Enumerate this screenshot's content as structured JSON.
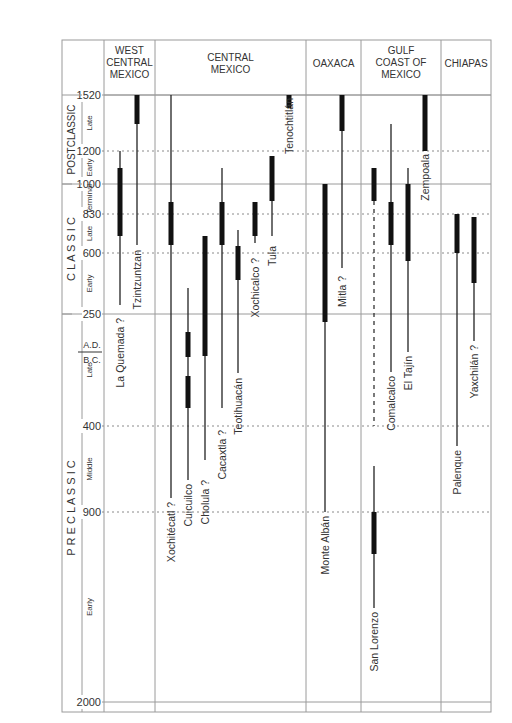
{
  "chart_data": {
    "type": "timeline",
    "title": "",
    "y_axis": {
      "ticks": [
        {
          "label": "1520",
          "y": 95,
          "style": "solid"
        },
        {
          "label": "1200",
          "y": 151,
          "style": "dotted"
        },
        {
          "label": "1000",
          "y": 184,
          "style": "solid"
        },
        {
          "label": "830",
          "y": 214,
          "style": "dotted"
        },
        {
          "label": "600",
          "y": 253,
          "style": "dotted"
        },
        {
          "label": "250",
          "y": 314,
          "style": "solid"
        },
        {
          "label": "400",
          "y": 426,
          "style": "dotted"
        },
        {
          "label": "900",
          "y": 512,
          "style": "dotted"
        },
        {
          "label": "2000",
          "y": 702,
          "style": "solid"
        }
      ],
      "era_divider": {
        "upper": "A.D.",
        "lower": "B.C.",
        "y": 352
      }
    },
    "periods": [
      {
        "name": "POSTCLASSIC",
        "y0": 95,
        "y1": 184,
        "subperiods": [
          {
            "name": "Late",
            "y0": 95,
            "y1": 151
          },
          {
            "name": "Early",
            "y0": 151,
            "y1": 184
          }
        ]
      },
      {
        "name": "C L A S S I C",
        "y0": 184,
        "y1": 314,
        "subperiods": [
          {
            "name": "Terminal",
            "y0": 184,
            "y1": 214
          },
          {
            "name": "Late",
            "y0": 214,
            "y1": 253
          },
          {
            "name": "Early",
            "y0": 253,
            "y1": 314
          }
        ]
      },
      {
        "name": "P R E C L A S S I C",
        "y0": 314,
        "y1": 702,
        "subperiods": [
          {
            "name": "Late",
            "y0": 314,
            "y1": 426
          },
          {
            "name": "Middle",
            "y0": 426,
            "y1": 512
          },
          {
            "name": "Early",
            "y0": 512,
            "y1": 702
          }
        ]
      }
    ],
    "regions": [
      {
        "name": [
          "WEST",
          "CENTRAL",
          "MEXICO"
        ],
        "x0": 104,
        "x1": 155
      },
      {
        "name": [
          "CENTRAL",
          "MEXICO"
        ],
        "x0": 155,
        "x1": 306
      },
      {
        "name": [
          "OAXACA"
        ],
        "x0": 306,
        "x1": 361
      },
      {
        "name": [
          "GULF",
          "COAST OF",
          "MEXICO"
        ],
        "x0": 361,
        "x1": 441
      },
      {
        "name": [
          "CHIAPAS"
        ],
        "x0": 441,
        "x1": 491
      }
    ],
    "sites": [
      {
        "name": "La Quemada",
        "region": "West Central Mexico",
        "x": 120,
        "line": [
          151,
          305
        ],
        "bar": [
          168,
          236
        ],
        "question": true,
        "label_y": 318
      },
      {
        "name": "Tzintzuntzan",
        "region": "West Central Mexico",
        "x": 137,
        "line": [
          95,
          245
        ],
        "bar": [
          95,
          124
        ],
        "question": false,
        "label_y": 250
      },
      {
        "name": "Xochitécatl",
        "region": "Central Mexico",
        "x": 171,
        "line": [
          95,
          498
        ],
        "bar": [
          202,
          245
        ],
        "question": true,
        "label_y": 502
      },
      {
        "name": "Cuicuilco",
        "region": "Central Mexico",
        "x": 188,
        "line": [
          288,
          480
        ],
        "bar": [
          332,
          357
        ],
        "bar2": [
          376,
          408
        ],
        "question": false,
        "label_y": 484
      },
      {
        "name": "Cholula",
        "region": "Central Mexico",
        "x": 205,
        "line": [
          236,
          460
        ],
        "bar": [
          236,
          356
        ],
        "question": true,
        "label_y": 480
      },
      {
        "name": "Cacaxtla",
        "region": "Central Mexico",
        "x": 222,
        "line": [
          168,
          408
        ],
        "bar": [
          202,
          245
        ],
        "question": true,
        "label_y": 430
      },
      {
        "name": "Teotihuacán",
        "region": "Central Mexico",
        "x": 238,
        "line": [
          230,
          373
        ],
        "bar": [
          246,
          280
        ],
        "question": false,
        "label_y": 378
      },
      {
        "name": "Xochicalco",
        "region": "Central Mexico",
        "x": 255,
        "line": [
          202,
          243
        ],
        "bar": [
          202,
          236
        ],
        "question": true,
        "label_y": 258
      },
      {
        "name": "Tula",
        "region": "Central Mexico",
        "x": 272,
        "line": [
          156,
          236
        ],
        "bar": [
          156,
          201
        ],
        "question": false,
        "label_y": 246
      },
      {
        "name": "Tenochtitlán",
        "region": "Central Mexico",
        "x": 289,
        "line": [
          95,
          108
        ],
        "bar": [
          95,
          108
        ],
        "question": false,
        "label_y": 98
      },
      {
        "name": "Monte Albán",
        "region": "Oaxaca",
        "x": 325,
        "line": [
          184,
          512
        ],
        "bar": [
          184,
          322
        ],
        "question": false,
        "label_y": 516
      },
      {
        "name": "Mitla",
        "region": "Oaxaca",
        "x": 342,
        "line": [
          95,
          268
        ],
        "bar": [
          95,
          131
        ],
        "question": true,
        "label_y": 276
      },
      {
        "name": "San Lorenzo",
        "region": "Gulf Coast of Mexico",
        "x": 374,
        "line": [
          168,
          608
        ],
        "bar": [
          168,
          201
        ],
        "bar2": [
          512,
          554
        ],
        "dashed": [
          201,
          426
        ],
        "question": false,
        "label_y": 612
      },
      {
        "name": "Comalcalco",
        "region": "Gulf Coast of Mexico",
        "x": 391,
        "line": [
          124,
          372
        ],
        "bar": [
          202,
          245
        ],
        "question": false,
        "label_y": 376
      },
      {
        "name": "El Tajín",
        "region": "Gulf Coast of Mexico",
        "x": 408,
        "line": [
          168,
          352
        ],
        "bar": [
          184,
          261
        ],
        "question": false,
        "label_y": 356
      },
      {
        "name": "Zempoala",
        "region": "Gulf Coast of Mexico",
        "x": 425,
        "line": [
          95,
          151
        ],
        "bar": [
          95,
          151
        ],
        "question": false,
        "label_y": 154
      },
      {
        "name": "Palenque",
        "region": "Chiapas",
        "x": 457,
        "line": [
          214,
          446
        ],
        "bar": [
          214,
          253
        ],
        "question": false,
        "label_y": 450
      },
      {
        "name": "Yaxchilán",
        "region": "Chiapas",
        "x": 474,
        "line": [
          217,
          341
        ],
        "bar": [
          217,
          283
        ],
        "question": true,
        "label_y": 345
      }
    ]
  }
}
